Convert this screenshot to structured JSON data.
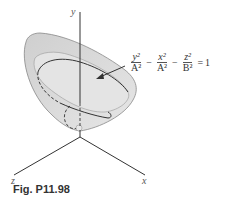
{
  "figure": {
    "caption": "Fig. P11.98",
    "axes": {
      "y": "y",
      "z": "z",
      "x": "x"
    },
    "equation": {
      "terms": [
        {
          "num": "y²",
          "den": "A²"
        },
        {
          "num": "x²",
          "den": "A²"
        },
        {
          "num": "z²",
          "den": "B²"
        }
      ],
      "operators": [
        "−",
        "−",
        "="
      ],
      "rhs": "1"
    },
    "colors": {
      "surface": "#d9d9d9",
      "surface_shade": "#bdbdbd",
      "line": "#333333"
    }
  }
}
